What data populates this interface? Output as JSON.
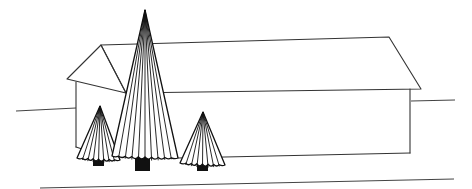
{
  "scene": {
    "title": "",
    "description_label": "Line drawing of a long house with a gabled roof and three conical trees",
    "colors": {
      "background": "#ffffff",
      "line": "#333333",
      "tree": "#111111"
    },
    "house": {
      "gable_peak": [
        101,
        45
      ],
      "gable_left_eave": [
        67,
        79
      ],
      "gable_right_eave": [
        126,
        93
      ],
      "ridge_right": [
        389,
        37
      ],
      "right_eave": [
        421,
        89
      ],
      "left_wall_top": [
        76,
        82
      ],
      "left_wall_bottom": [
        76,
        147
      ],
      "right_wall_top": [
        410,
        89
      ],
      "right_wall_bottom": [
        410,
        153
      ]
    },
    "ground_lines": [
      {
        "from": [
          16,
          111
        ],
        "to": [
          76,
          108
        ]
      },
      {
        "from": [
          411,
          101
        ],
        "to": [
          455,
          100
        ]
      },
      {
        "from": [
          40,
          188
        ],
        "to": [
          454,
          179
        ]
      }
    ],
    "trees": [
      {
        "name": "small-left-tree",
        "apex": [
          100,
          106
        ],
        "base_left": [
          77,
          158
        ],
        "base_right": [
          120,
          160
        ],
        "ribs": 8,
        "trunk": [
          93,
          160,
          11,
          6
        ]
      },
      {
        "name": "tall-center-tree",
        "apex": [
          145,
          10
        ],
        "base_left": [
          112,
          156
        ],
        "base_right": [
          178,
          158
        ],
        "ribs": 10,
        "trunk": [
          135,
          158,
          15,
          13
        ]
      },
      {
        "name": "small-right-tree",
        "apex": [
          203,
          112
        ],
        "base_left": [
          180,
          163
        ],
        "base_right": [
          225,
          165
        ],
        "ribs": 8,
        "trunk": [
          197,
          165,
          11,
          6
        ]
      }
    ]
  }
}
